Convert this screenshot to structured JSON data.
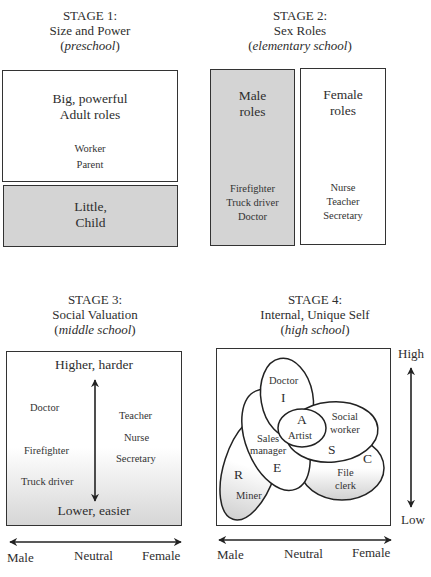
{
  "stage1": {
    "heading": "STAGE 1:",
    "subtitle": "Size and Power",
    "school": "preschool",
    "top_box": {
      "title_line1": "Big, powerful",
      "title_line2": "Adult roles",
      "items": [
        "Worker",
        "Parent"
      ]
    },
    "bottom_box": {
      "title_line1": "Little,",
      "title_line2": "Child"
    }
  },
  "stage2": {
    "heading": "STAGE 2:",
    "subtitle": "Sex Roles",
    "school": "elementary school",
    "male_box": {
      "title_line1": "Male",
      "title_line2": "roles",
      "items": [
        "Firefighter",
        "Truck driver",
        "Doctor"
      ]
    },
    "female_box": {
      "title_line1": "Female",
      "title_line2": "roles",
      "items": [
        "Nurse",
        "Teacher",
        "Secretary"
      ]
    }
  },
  "stage3": {
    "heading": "STAGE 3:",
    "subtitle": "Social Valuation",
    "school": "middle school",
    "top_label": "Higher, harder",
    "bottom_label": "Lower, easier",
    "male_items": [
      "Doctor",
      "Firefighter",
      "Truck driver"
    ],
    "female_items": [
      "Teacher",
      "Nurse",
      "Secretary"
    ],
    "x_axis": {
      "left": "Male",
      "center": "Neutral",
      "right": "Female"
    }
  },
  "stage4": {
    "heading": "STAGE 4:",
    "subtitle": "Internal, Unique Self",
    "school": "high school",
    "regions": [
      {
        "letter": "I",
        "job": "Doctor"
      },
      {
        "letter": "A",
        "job": "Artist"
      },
      {
        "letter": "S",
        "job_line1": "Social",
        "job_line2": "worker"
      },
      {
        "letter": "E",
        "job_line1": "Sales",
        "job_line2": "manager"
      },
      {
        "letter": "R",
        "job": "Miner"
      },
      {
        "letter": "C",
        "job_line1": "File",
        "job_line2": "clerk"
      }
    ],
    "y_axis": {
      "top": "High",
      "bottom": "Low"
    },
    "x_axis": {
      "left": "Male",
      "center": "Neutral",
      "right": "Female"
    }
  },
  "colors": {
    "line": "#333333",
    "shade": "#d4d4d4",
    "text": "#2e2e2e"
  }
}
